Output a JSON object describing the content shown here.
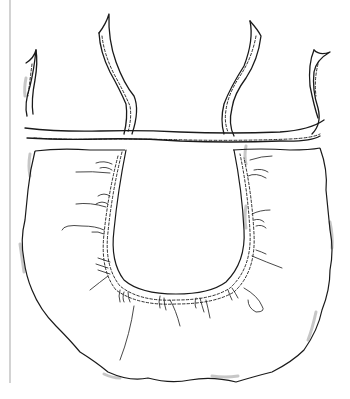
{
  "illustration": {
    "subject": "gathered apron with waistband ties",
    "colors": {
      "background": "#ffffff",
      "ink": "#1a1a1a",
      "shadow": "#9a9a9a",
      "frame_rule": "#b5b5b5"
    }
  }
}
